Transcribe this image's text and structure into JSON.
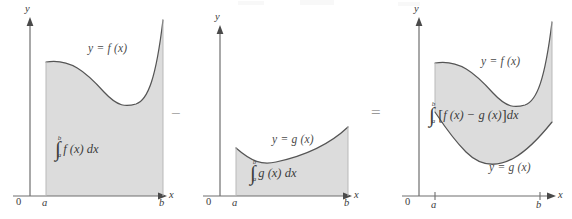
{
  "figure": {
    "caption_visible": false,
    "background_color": "#ffffff",
    "shade_color": "#dcdcdc",
    "curve_color": "#555555",
    "axis_color": "#6e6e6e",
    "label_color": "#4a4a4a"
  },
  "operators": {
    "minus": "−",
    "equals": "="
  },
  "panels": [
    {
      "id": "panel-f",
      "axis": {
        "y_label": "y",
        "x_label": "x",
        "origin_label": "0",
        "left_tick_label": "a",
        "right_tick_label": "b"
      },
      "curve_label": "y = f (x)",
      "integral": {
        "symbol": "∫",
        "lower_limit": "a",
        "upper_limit": "b",
        "body": "f (x) dx",
        "full_text": "∫_a^b f(x) dx"
      },
      "shaded_region": "area under f(x) from a to b down to the x-axis"
    },
    {
      "id": "panel-g",
      "axis": {
        "y_label": "y",
        "x_label": "x",
        "origin_label": "0",
        "left_tick_label": "a",
        "right_tick_label": "b"
      },
      "curve_label": "y = g (x)",
      "integral": {
        "symbol": "∫",
        "lower_limit": "a",
        "upper_limit": "b",
        "body": "g (x) dx",
        "full_text": "∫_a^b g(x) dx"
      },
      "shaded_region": "area under g(x) from a to b down to the x-axis"
    },
    {
      "id": "panel-diff",
      "axis": {
        "y_label": "y",
        "x_label": "x",
        "origin_label": "0",
        "left_tick_label": "a",
        "right_tick_label": "b"
      },
      "curve_label_top": "y = f (x)",
      "curve_label_bottom": "y = g (x)",
      "integral": {
        "symbol": "∫",
        "lower_limit": "a",
        "upper_limit": "b",
        "bracket_open": "[",
        "bracket_close": "]",
        "body": "f (x) − g (x)",
        "differential": "dx",
        "full_text": "∫_a^b [ f(x) − g(x) ] dx"
      },
      "shaded_region": "band between f(x) above and g(x) below from a to b"
    }
  ]
}
